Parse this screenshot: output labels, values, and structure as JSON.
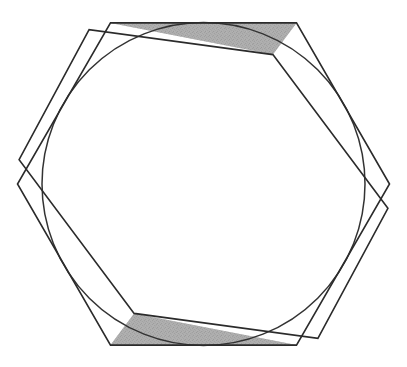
{
  "figure": {
    "title": "Hexagonal band with inscribed circle",
    "background_color": "#ffffff",
    "canvas": {
      "width": 407,
      "height": 367
    }
  },
  "style": {
    "fill_color": "#a9a9a9",
    "fill_color_light": "#bcbcbc",
    "fill_color_dark": "#9a9a9a",
    "stroke_color": "#2b2b2b",
    "stroke_width": 1.6,
    "circle_stroke_color": "#333333",
    "circle_stroke_width": 1.5,
    "stipple_opacity": 0.45
  },
  "chart_data": {
    "type": "diagram",
    "title": "Hexagonal band with inscribed circle",
    "shapes": [
      {
        "name": "outer-hexagon",
        "type": "polygon",
        "sides": 6,
        "center": [
          203.5,
          184.0
        ],
        "circumradius": 186.0,
        "rotation_deg": 0.0,
        "orientation": "pointy-left-right",
        "vertices": [
          [
            389.5,
            184.0
          ],
          [
            296.5,
            22.9
          ],
          [
            110.5,
            22.9
          ],
          [
            17.5,
            184.0
          ],
          [
            110.5,
            345.1
          ],
          [
            296.5,
            345.1
          ]
        ]
      },
      {
        "name": "inner-hexagon",
        "type": "polygon",
        "sides": 6,
        "center": [
          203.5,
          184.0
        ],
        "circumradius": 186.0,
        "rotation_deg": 7.5,
        "orientation": "pointy-left-right",
        "vertices": [
          [
            387.9,
            208.3
          ],
          [
            272.9,
            54.6
          ],
          [
            89.1,
            29.7
          ],
          [
            19.1,
            159.7
          ],
          [
            134.1,
            313.4
          ],
          [
            317.9,
            338.3
          ]
        ]
      },
      {
        "name": "inscribed-circle",
        "type": "circle",
        "center": [
          203.5,
          184.0
        ],
        "radius": 161.5,
        "filled": false
      }
    ],
    "layout": {
      "grid": false,
      "legend": null,
      "axes": false
    }
  }
}
